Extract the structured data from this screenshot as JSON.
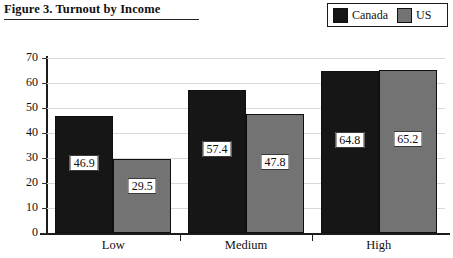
{
  "figure": {
    "title": "Figure 3. Turnout by Income"
  },
  "legend": {
    "position": "top-right",
    "items": [
      {
        "label": "Canada",
        "color": "#161616",
        "swatch_name": "legend-swatch-canada"
      },
      {
        "label": "US",
        "color": "#737373",
        "swatch_name": "legend-swatch-us"
      }
    ]
  },
  "chart_data": {
    "type": "bar",
    "title": "Figure 3. Turnout by Income",
    "xlabel": "",
    "ylabel": "",
    "categories": [
      "Low",
      "Medium",
      "High"
    ],
    "series": [
      {
        "name": "Canada",
        "color": "#161616",
        "values": [
          46.9,
          57.4,
          64.8
        ]
      },
      {
        "name": "US",
        "color": "#737373",
        "values": [
          29.5,
          47.8,
          65.2
        ]
      }
    ],
    "value_labels": {
      "Canada": [
        "46.9",
        "57.4",
        "64.8"
      ],
      "US": [
        "29.5",
        "47.8",
        "65.2"
      ]
    },
    "ylim": [
      0,
      70
    ],
    "ytick_values": [
      0,
      10,
      20,
      30,
      40,
      50,
      60,
      70
    ],
    "ytick_labels": [
      "0",
      "10",
      "20",
      "30",
      "40",
      "50",
      "60",
      "70"
    ],
    "grid": true,
    "grid_axis": "y",
    "legend_position": "top-right",
    "bar_group_gap": true,
    "bars_adjacent_within_group": true
  }
}
